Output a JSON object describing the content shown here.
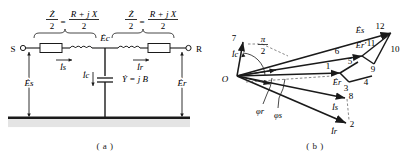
{
  "figure": {
    "panels": [
      {
        "id": "a",
        "caption": "( a )",
        "type": "circuit-diagram",
        "name": "nominal-pi-equivalent-circuit",
        "terminals": [
          {
            "name": "sending-end",
            "label": "S"
          },
          {
            "name": "receiving-end",
            "label": "R"
          }
        ],
        "branch_labels": [
          {
            "name": "left-series-impedance",
            "numerator": "Ż",
            "denominator": "2",
            "equals": "=",
            "rhs_numerator": "R + j X",
            "rhs_denominator": "2"
          },
          {
            "name": "right-series-impedance",
            "numerator": "Ż",
            "denominator": "2",
            "equals": "=",
            "rhs_numerator": "R + j X",
            "rhs_denominator": "2"
          }
        ],
        "node_label": "Ėc",
        "shunt": {
          "current_label": "İc",
          "admittance_label": "Ẏ = j B"
        },
        "currents": [
          {
            "name": "sending-current",
            "label": "İs"
          },
          {
            "name": "receiving-current",
            "label": "İr"
          }
        ],
        "voltages": [
          {
            "name": "sending-voltage",
            "label": "Ės"
          },
          {
            "name": "receiving-voltage",
            "label": "Ėr"
          }
        ],
        "ground_label": ""
      },
      {
        "id": "b",
        "caption": "( b )",
        "type": "phasor-diagram",
        "name": "phasor-diagram",
        "origin_label": "O",
        "angle_label": {
          "symbol": "π",
          "denominator": "2"
        },
        "phasors": [
          {
            "name": "capacitive-current-phasor",
            "label": "İc"
          },
          {
            "name": "receiving-voltage-phasor",
            "label": "Ėr"
          },
          {
            "name": "sending-voltage-phasor",
            "label": "Ės"
          },
          {
            "name": "intermediate-voltage-phasor",
            "label": "Ėr'"
          },
          {
            "name": "sending-current-phasor",
            "label": "İs"
          },
          {
            "name": "receiving-current-phasor",
            "label": "İr"
          }
        ],
        "angles": [
          {
            "name": "receiving-power-angle",
            "label": "φr"
          },
          {
            "name": "sending-power-angle",
            "label": "φs"
          }
        ],
        "vertex_numbers": [
          "1",
          "2",
          "3",
          "4",
          "5",
          "6",
          "7",
          "8",
          "9",
          "10",
          "11",
          "12"
        ]
      }
    ]
  },
  "style": {
    "line_color": "#1a1a1a",
    "ground_fill": "#e4e4e4",
    "text_color": "#1a1a1a",
    "dashed_color": "#555555"
  }
}
